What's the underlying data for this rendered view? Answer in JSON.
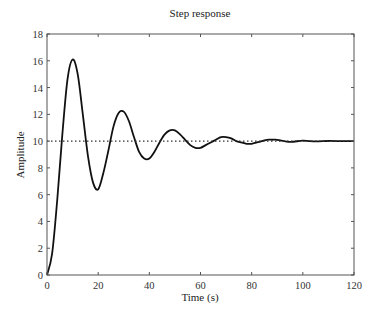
{
  "chart_data": {
    "type": "line",
    "title": "Step response",
    "xlabel": "Time (s)",
    "ylabel": "Amplitude",
    "xlim": [
      0,
      120
    ],
    "ylim": [
      0,
      18
    ],
    "xticks": [
      0,
      20,
      40,
      60,
      80,
      100,
      120
    ],
    "yticks": [
      0,
      2,
      4,
      6,
      8,
      10,
      12,
      14,
      16,
      18
    ],
    "grid": false,
    "legend": null,
    "series": [
      {
        "name": "Step response",
        "style": "solid",
        "color": "#111111",
        "x": [
          0,
          2,
          4,
          6,
          8,
          10,
          12,
          14,
          16,
          18,
          20,
          22,
          24,
          26,
          28,
          30,
          32,
          34,
          36,
          38,
          40,
          42,
          44,
          46,
          48,
          50,
          52,
          54,
          56,
          58,
          60,
          62,
          64,
          66,
          68,
          70,
          72,
          74,
          76,
          78,
          80,
          82,
          84,
          86,
          88,
          90,
          95,
          100,
          105,
          110,
          115,
          120
        ],
        "y": [
          0,
          1.6,
          5.6,
          10.5,
          14.6,
          16.1,
          15.0,
          12.0,
          8.9,
          6.9,
          6.4,
          7.6,
          9.3,
          11.1,
          12.1,
          12.2,
          11.5,
          10.3,
          9.2,
          8.7,
          8.7,
          9.2,
          9.9,
          10.5,
          10.8,
          10.8,
          10.5,
          10.1,
          9.7,
          9.5,
          9.5,
          9.7,
          9.9,
          10.1,
          10.3,
          10.3,
          10.2,
          10.0,
          9.9,
          9.8,
          9.8,
          9.9,
          10.0,
          10.1,
          10.1,
          10.1,
          9.95,
          10.03,
          9.98,
          10.01,
          10.0,
          10.0
        ]
      },
      {
        "name": "Final value",
        "style": "dotted",
        "color": "#333333",
        "x": [
          0,
          120
        ],
        "y": [
          10,
          10
        ]
      }
    ]
  }
}
